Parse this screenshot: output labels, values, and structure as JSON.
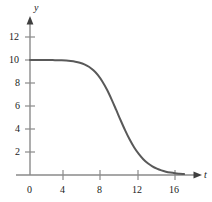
{
  "figure": {
    "background_color": "#ffffff",
    "axis_color": "#8a8a8a",
    "curve_color": "#595959",
    "label_color": "#1a1a1a"
  },
  "axes": {
    "x_name": "t",
    "y_name": "y",
    "origin_label": "0"
  },
  "chart_data": {
    "type": "line",
    "title": "",
    "subtitle": "",
    "xlabel": "t",
    "ylabel": "y",
    "xlim": [
      0,
      17.5
    ],
    "ylim": [
      0,
      13.5
    ],
    "xticks": [
      0,
      4,
      8,
      12,
      16
    ],
    "xtick_labels": [
      "0",
      "4",
      "8",
      "12",
      "16"
    ],
    "yticks": [
      2,
      4,
      6,
      8,
      10,
      12
    ],
    "ytick_labels": [
      "2",
      "4",
      "6",
      "8",
      "10",
      "12"
    ],
    "grid": false,
    "legend": null,
    "legend_position": "none",
    "annotations": [],
    "series": [
      {
        "name": "y(t)",
        "description": "logistic decay from 10 to 0, inflection near t = 10.5",
        "x": [
          0,
          0.5,
          1,
          1.5,
          2,
          2.5,
          3,
          3.5,
          4,
          4.5,
          5,
          5.5,
          6,
          6.5,
          7,
          7.5,
          8,
          8.5,
          9,
          9.5,
          10,
          10.5,
          11,
          11.5,
          12,
          12.5,
          13,
          13.5,
          14,
          14.5,
          15,
          15.5,
          16,
          16.5,
          17
        ],
        "y": [
          10.0,
          10.0,
          10.0,
          10.0,
          10.0,
          9.99,
          9.98,
          9.97,
          9.95,
          9.91,
          9.85,
          9.76,
          9.62,
          9.41,
          9.1,
          8.68,
          8.11,
          7.41,
          6.58,
          5.68,
          4.76,
          3.88,
          3.08,
          2.39,
          1.83,
          1.37,
          1.02,
          0.75,
          0.55,
          0.4,
          0.29,
          0.21,
          0.15,
          0.11,
          0.08
        ]
      }
    ]
  },
  "tick_marks": {
    "x_positions_px": [
      30,
      63,
      100,
      138,
      175
    ],
    "y_positions_px": [
      152,
      129,
      106,
      83,
      60,
      37
    ]
  }
}
